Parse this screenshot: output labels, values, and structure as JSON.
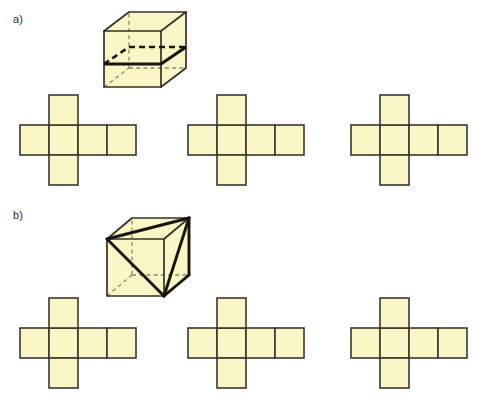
{
  "figure": {
    "background_color": "#fefefe",
    "face_fill_color": "#faf6c6",
    "edge_color": "#35302a",
    "hidden_edge_color": "#8c8672",
    "highlight_color": "#17150f"
  },
  "parts": [
    {
      "id": "a",
      "label": "a)",
      "cube": {
        "name": "cube-with-horizontal-cross-section",
        "description": "Cube drawn in oblique projection with a horizontal square cross-section at mid height; the front and right-front cut edges are drawn as thick solid lines and the two hidden rear cut edges are drawn as thick dashed lines.",
        "cut_section_shape": "square",
        "visible_cut_edges": 2,
        "hidden_cut_edges": 2
      },
      "nets": [
        {
          "name": "net-a-1",
          "squares": 6,
          "shape": "cross",
          "arm_row_length": 4,
          "stem_column_index": 1
        },
        {
          "name": "net-a-2",
          "squares": 6,
          "shape": "cross",
          "arm_row_length": 4,
          "stem_column_index": 1
        },
        {
          "name": "net-a-3",
          "squares": 6,
          "shape": "cross",
          "arm_row_length": 4,
          "stem_column_index": 1
        }
      ]
    },
    {
      "id": "b",
      "label": "b)",
      "cube": {
        "name": "cube-with-triangular-cross-section",
        "description": "Cube drawn in oblique projection with three thick diagonals joining the front-top-left vertex, the rear-top-right vertex and the front-bottom-right vertex, forming a triangular cross-section.",
        "cut_section_shape": "triangle",
        "visible_cut_edges": 3,
        "hidden_cut_edges": 0
      },
      "nets": [
        {
          "name": "net-b-1",
          "squares": 6,
          "shape": "cross",
          "arm_row_length": 4,
          "stem_column_index": 1
        },
        {
          "name": "net-b-2",
          "squares": 6,
          "shape": "cross",
          "arm_row_length": 4,
          "stem_column_index": 1
        },
        {
          "name": "net-b-3",
          "squares": 6,
          "shape": "cross",
          "arm_row_length": 4,
          "stem_column_index": 1
        }
      ]
    }
  ]
}
